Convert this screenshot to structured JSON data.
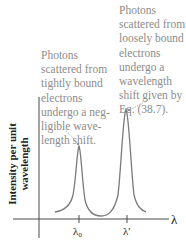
{
  "figure": {
    "type": "compton-scattering-spectrum",
    "y_axis_label_line1": "Intensity per unit",
    "y_axis_label_line2": "wavelength",
    "x_axis_label": "λ",
    "ticks": [
      {
        "label": "λ₀",
        "x": 79
      },
      {
        "label": "λ′",
        "x": 127
      }
    ],
    "annotations": {
      "left": {
        "lines": [
          "Photons",
          "scattered from",
          "tightly bound",
          "electrons",
          "undergo a neg-",
          "ligible wave-",
          "length shift."
        ]
      },
      "right": {
        "lines": [
          "Photons",
          "scattered from",
          "loosely bound",
          "electrons",
          "undergo a",
          "wavelength",
          "shift given by",
          "Eq. (38.7)."
        ]
      }
    },
    "peaks": [
      {
        "name": "unshifted peak",
        "at": "λ₀",
        "relative_height": 0.72
      },
      {
        "name": "shifted peak",
        "at": "λ′",
        "relative_height": 1.0
      }
    ],
    "colors": {
      "axis": "#4a4a4a",
      "curve": "#7a7a7a",
      "annotation_text": "#8c8c8c",
      "label_text": "#222222"
    }
  }
}
